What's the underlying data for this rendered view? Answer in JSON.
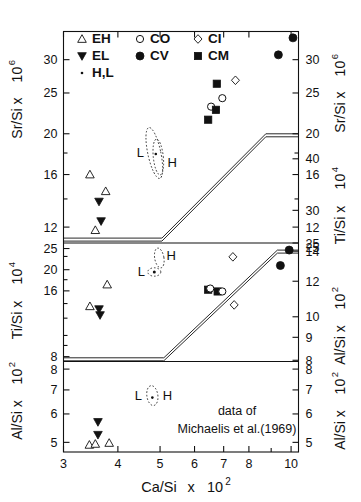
{
  "figure": {
    "caption_line1": "data  of",
    "caption_line2": "Michaelis et al.(1969)",
    "xlabel_main": "Ca/Si",
    "xlabel_mult": "x",
    "xlabel_pow_base": "10",
    "xlabel_pow_exp": "2"
  },
  "legend": {
    "items": [
      {
        "key": "EH",
        "label": "EH",
        "marker": "open-triangle-up"
      },
      {
        "key": "CO",
        "label": "CO",
        "marker": "open-circle"
      },
      {
        "key": "CI",
        "label": "CI",
        "marker": "open-diamond"
      },
      {
        "key": "EL",
        "label": "EL",
        "marker": "filled-triangle-down"
      },
      {
        "key": "CV",
        "label": "CV",
        "marker": "filled-circle"
      },
      {
        "key": "CM",
        "label": "CM",
        "marker": "filled-square"
      },
      {
        "key": "HL",
        "label": "H,L",
        "marker": "dot"
      }
    ]
  },
  "annotations": {
    "low_label": "L",
    "high_label": "H"
  },
  "chart_data": {
    "type": "scatter",
    "title": "",
    "xlabel": "Ca/Si x 10^2",
    "xscale": "log",
    "xlim": [
      3,
      10.4
    ],
    "xticks": [
      3,
      4,
      5,
      6,
      7,
      8,
      10
    ],
    "xticklabels": [
      "3",
      "4",
      "5",
      "6",
      "7",
      "8",
      "10"
    ],
    "grid": false,
    "legend_position": "top-left-inside",
    "panels": [
      {
        "name": "top-panel",
        "ylabel_left": "Sr/Si x 10^6",
        "ylabel_right": "Sr/Si x 10^6",
        "yscale": "log",
        "ylim": [
          11.0,
          35.0
        ],
        "yticks_labeled": [
          30,
          25,
          20,
          16,
          12
        ],
        "yticks_minor": [
          18,
          14
        ],
        "series": [
          {
            "name": "EH",
            "marker": "open-triangle-up",
            "points": [
              [
                3.45,
                16.0
              ],
              [
                3.75,
                14.6
              ],
              [
                3.55,
                11.8
              ]
            ]
          },
          {
            "name": "EL",
            "marker": "filled-triangle-down",
            "points": [
              [
                3.62,
                13.8
              ],
              [
                3.66,
                12.4
              ]
            ]
          },
          {
            "name": "CO",
            "marker": "open-circle",
            "points": [
              [
                6.55,
                23.2
              ],
              [
                6.95,
                24.3
              ]
            ]
          },
          {
            "name": "CM",
            "marker": "filled-square",
            "points": [
              [
                6.75,
                26.3
              ],
              [
                6.45,
                21.6
              ],
              [
                6.72,
                22.8
              ]
            ]
          },
          {
            "name": "CI",
            "marker": "open-diamond",
            "points": [
              [
                7.45,
                26.8
              ]
            ]
          },
          {
            "name": "CV",
            "marker": "filled-circle",
            "points": [
              [
                9.35,
                30.8
              ],
              [
                10.1,
                33.8
              ]
            ]
          }
        ],
        "boundary_band": {
          "description": "double-line trend boundary",
          "vertices": [
            [
              3.0,
              11.3
            ],
            [
              5.05,
              11.3
            ],
            [
              8.75,
              20.0
            ],
            [
              10.4,
              20.0
            ]
          ]
        },
        "ellipse_annotation": {
          "x": 4.85,
          "y_center": 18.0,
          "label_left": "L",
          "label_right": "H"
        }
      },
      {
        "name": "middle-panel",
        "ylabel_left": "Ti/Si x 10^4",
        "ylabel_right": "Ti/Si x 10^4",
        "yscale": "log",
        "ylim": [
          7.6,
          26.5
        ],
        "yticks_labeled": [
          25,
          20,
          16,
          8
        ],
        "yticks_minor": [
          23,
          18,
          14,
          12,
          10,
          9
        ],
        "right_ylabel": "Al/Si x 10^2",
        "right_yticks_labeled": [
          14,
          12,
          10,
          9,
          8
        ],
        "series": [
          {
            "name": "EH",
            "marker": "open-triangle-up",
            "points": [
              [
                3.78,
                17.1
              ],
              [
                3.45,
                13.6
              ]
            ]
          },
          {
            "name": "EL",
            "marker": "filled-triangle-down",
            "points": [
              [
                3.62,
                13.2
              ],
              [
                3.64,
                12.4
              ]
            ]
          },
          {
            "name": "CM",
            "marker": "filled-square",
            "points": [
              [
                6.45,
                16.2
              ],
              [
                6.78,
                15.9
              ]
            ]
          },
          {
            "name": "CO",
            "marker": "open-circle",
            "points": [
              [
                6.52,
                16.4
              ],
              [
                6.95,
                15.9
              ]
            ]
          },
          {
            "name": "CI",
            "marker": "open-diamond",
            "points": [
              [
                7.35,
                22.9
              ],
              [
                7.4,
                13.8
              ]
            ]
          },
          {
            "name": "CV",
            "marker": "filled-circle",
            "points": [
              [
                9.9,
                24.6
              ],
              [
                9.45,
                20.9
              ]
            ]
          }
        ],
        "boundary_band": {
          "description": "double-line trend boundary",
          "vertices": [
            [
              3.0,
              7.9
            ],
            [
              5.1,
              7.9
            ],
            [
              9.3,
              24.6
            ],
            [
              10.4,
              24.6
            ]
          ]
        },
        "ellipse_annotation": {
          "x": 4.85,
          "y_center": 20.8,
          "label_left": "L",
          "label_right": "H"
        }
      },
      {
        "name": "bottom-panel",
        "ylabel_left": "Al/Si x 10^2",
        "ylabel_right": "Al/Si x 10^2",
        "yscale": "log",
        "ylim": [
          4.7,
          8.4
        ],
        "yticks_labeled": [
          8,
          7,
          6,
          5
        ],
        "yticks_minor": [],
        "series": [
          {
            "name": "EL",
            "marker": "filled-triangle-down",
            "points": [
              [
                3.6,
                5.7
              ],
              [
                3.6,
                5.25
              ]
            ]
          },
          {
            "name": "EH",
            "marker": "open-triangle-up",
            "points": [
              [
                3.44,
                4.92
              ],
              [
                3.55,
                4.95
              ],
              [
                3.82,
                4.98
              ]
            ]
          }
        ],
        "ellipse_annotation": {
          "x": 4.8,
          "y_center": 6.75,
          "label_left": "L",
          "label_right": "H"
        }
      }
    ]
  }
}
